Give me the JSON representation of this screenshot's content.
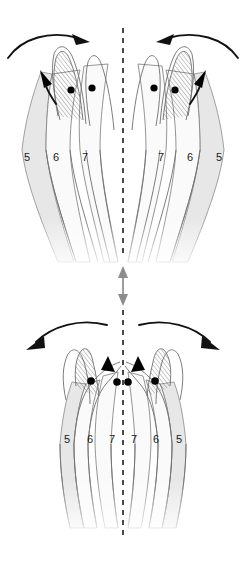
{
  "figure": {
    "title_visible": false,
    "background_color": "#ffffff",
    "panels": [
      {
        "id": "upper-panel",
        "position": "top",
        "description": "paired mirrored structures angled inward with curved rotation arrows pointing toward midline",
        "midline": "vertical dashed line",
        "rotation_arrows": [
          {
            "side": "left",
            "direction": "rightward",
            "head": "right"
          },
          {
            "side": "right",
            "direction": "leftward",
            "head": "left"
          }
        ],
        "labels_left": [
          "5",
          "6",
          "7"
        ],
        "labels_right": [
          "7",
          "6",
          "5"
        ],
        "dot_count": 4,
        "tip_arrow_count": 2
      },
      {
        "id": "lower-panel",
        "position": "bottom",
        "description": "paired mirrored structures converging at midline with curved rotation arrows pointing outward",
        "midline": "vertical dashed line",
        "rotation_arrows": [
          {
            "side": "left",
            "direction": "leftward",
            "head": "left"
          },
          {
            "side": "right",
            "direction": "rightward",
            "head": "right"
          }
        ],
        "labels_left": [
          "5",
          "6",
          "7"
        ],
        "labels_right": [
          "7",
          "6",
          "5"
        ],
        "dot_count": 4,
        "tip_arrow_count": 2
      }
    ],
    "between_panels": {
      "marker": "vertical double-headed arrow",
      "color": "#8c8c8c"
    },
    "colors": {
      "outline": "#6e6e6e",
      "shaded_region": "#e7e7e7",
      "arrow": "#111111",
      "midline": "#2a2a2a",
      "dot": "#000000",
      "vertical_arrow": "#8c8c8c",
      "label_text": "#1a1a1a"
    },
    "labels": {
      "upper": {
        "l5": "5",
        "l6": "6",
        "l7": "7",
        "r7": "7",
        "r6": "6",
        "r5": "5"
      },
      "lower": {
        "l5": "5",
        "l6": "6",
        "l7": "7",
        "r7": "7",
        "r6": "6",
        "r5": "5"
      }
    }
  }
}
